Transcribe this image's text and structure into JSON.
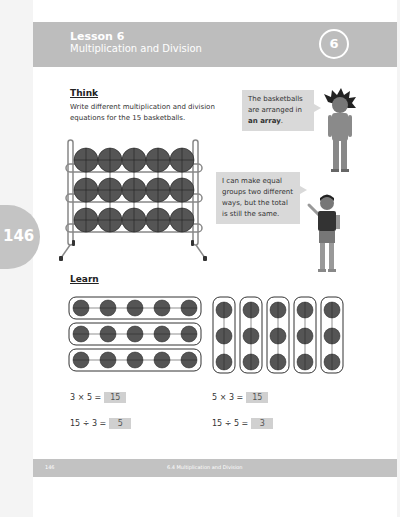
{
  "header": {
    "lesson": "Lesson 6",
    "title": "Multiplication and Division",
    "badge_number": "6"
  },
  "side_tab": {
    "page_number": "146"
  },
  "think": {
    "heading": "Think",
    "prompt": "Write different multiplication and division equations for the 15 basketballs."
  },
  "bubbles": {
    "top": {
      "text_before": "The basketballs are arranged in",
      "text_bold": "an array",
      "text_after": "."
    },
    "bottom": {
      "text": "I can make equal groups two different ways, but the total is still the same."
    }
  },
  "learn": {
    "heading": "Learn",
    "rows_array": {
      "rows": 3,
      "cols": 5
    },
    "cols_array": {
      "rows": 3,
      "cols": 5
    }
  },
  "equations": [
    {
      "expr": "3 × 5 =",
      "answer": "15"
    },
    {
      "expr": "5 × 3 =",
      "answer": "15"
    },
    {
      "expr": "15 ÷ 3 =",
      "answer": "5"
    },
    {
      "expr": "15 ÷ 5 =",
      "answer": "3"
    }
  ],
  "footer": {
    "page_number": "146",
    "title": "6.4 Multiplication and Division"
  },
  "colors": {
    "header_band": "#bdbdbd",
    "bubble": "#d9d9d9",
    "answer_box": "#d0d0d0",
    "basketball": "#555555"
  }
}
